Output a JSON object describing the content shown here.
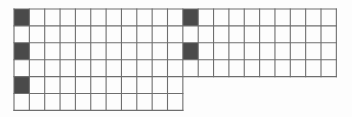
{
  "figure": {
    "background_color": "#fdfdfd",
    "cell_fill_empty": "#ffffff",
    "cell_fill_marked": "#4a4a4a",
    "grid_line_color": "#6e6e6e",
    "grid_line_width": 1.1,
    "origin_x": 14,
    "origin_y": 9,
    "cell_width": 15.35,
    "cell_height": 16.9
  },
  "grid": {
    "total_columns": 21,
    "total_rows": 6,
    "sections": [
      {
        "name": "left-tall-section",
        "start_column": 0,
        "column_count": 11,
        "row_count": 6
      },
      {
        "name": "right-short-section",
        "start_column": 11,
        "column_count": 10,
        "row_count": 4
      }
    ],
    "column_heights": [
      6,
      6,
      6,
      6,
      6,
      6,
      6,
      6,
      6,
      6,
      6,
      4,
      4,
      4,
      4,
      4,
      4,
      4,
      4,
      4,
      4
    ],
    "marked_cells": [
      {
        "column": 0,
        "row": 0
      },
      {
        "column": 0,
        "row": 2
      },
      {
        "column": 0,
        "row": 4
      },
      {
        "column": 11,
        "row": 0
      },
      {
        "column": 11,
        "row": 2
      }
    ],
    "marked_cell_count": 5
  },
  "labels": {
    "caption": ""
  }
}
